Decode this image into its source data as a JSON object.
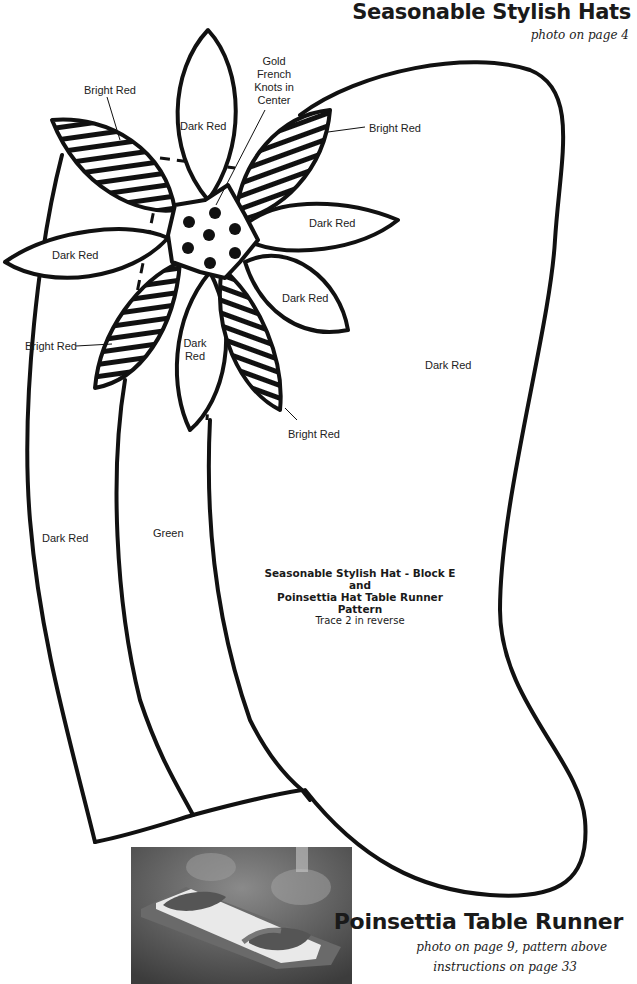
{
  "header": {
    "title": "Seasonable Stylish Hats",
    "subtitle": "photo on page 4"
  },
  "pattern": {
    "labels": {
      "gold_knots": [
        "Gold",
        "French",
        "Knots in",
        "Center"
      ],
      "petal_top": "Dark Red",
      "bright_red_top_left": "Bright Red",
      "bright_red_top_right": "Bright Red",
      "petal_right": "Dark Red",
      "petal_left": "Dark Red",
      "petal_lower_right": "Dark Red",
      "bright_red_left": "Bright Red",
      "petal_bottom": [
        "Dark",
        "Red"
      ],
      "bright_red_bottom": "Bright Red",
      "hat_crown": "Dark Red",
      "brim_left": "Dark Red",
      "brim_band": "Green"
    },
    "caption": {
      "line1": "Seasonable Stylish Hat - Block E",
      "line2": "and",
      "line3": "Poinsettia Hat Table Runner",
      "line4": "Pattern",
      "note": "Trace 2 in reverse"
    },
    "colors": {
      "outline": "#111111",
      "paper": "#ffffff"
    }
  },
  "footer": {
    "title": "Poinsettia Table Runner",
    "subtitle_line1": "photo on page 9, pattern above",
    "subtitle_line2": "instructions on page 33",
    "photo_alt": "Poinsettia table runner photo"
  }
}
